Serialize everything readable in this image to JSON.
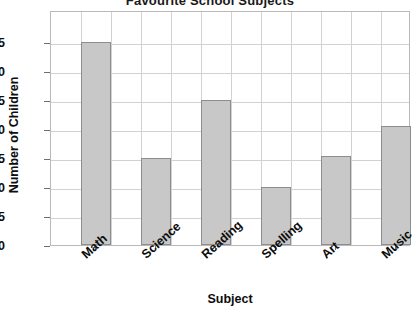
{
  "chart_data": {
    "type": "bar",
    "title": "Favourite School Subjects",
    "xlabel": "Subject",
    "ylabel": "Number of Children",
    "categories": [
      "Math",
      "Science",
      "Reading",
      "Spelling",
      "Art",
      "Music"
    ],
    "values": [
      35,
      15,
      25,
      10,
      15.3,
      20.5
    ],
    "ylim": [
      0,
      40.5
    ],
    "yticks": [
      0,
      5,
      10,
      15,
      20,
      25,
      30,
      35
    ],
    "ytick_labels": [
      "0",
      "5",
      "10",
      "15",
      "20",
      "25",
      "30",
      "35"
    ],
    "grid": true,
    "grid_axis": "both",
    "legend": "none",
    "bar_color": "#c8c8c8",
    "bar_edge_color": "#8d8d8d",
    "grid_color": "#d2d2d2",
    "axis_color": "#b9b9b9",
    "text_color": "#0d0d0d"
  }
}
